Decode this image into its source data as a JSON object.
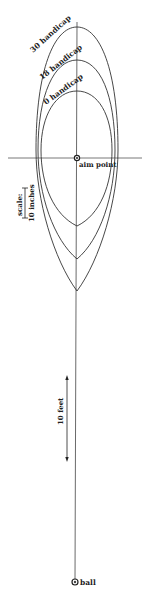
{
  "diagram": {
    "colors": {
      "line": "#333333",
      "background": "#ffffff"
    },
    "contours": [
      {
        "label": "30 handicap",
        "top_y": 27,
        "bottom_y": 291,
        "left_x": 36,
        "right_x": 118
      },
      {
        "label": "18 handicap",
        "top_y": 60,
        "bottom_y": 259,
        "left_x": 38,
        "right_x": 115
      },
      {
        "label": "0 handicap",
        "top_y": 91,
        "bottom_y": 226,
        "left_x": 41,
        "right_x": 112
      }
    ],
    "aim_point": {
      "label": "aim point",
      "x": 77,
      "y": 158
    },
    "ball": {
      "label": "ball",
      "x": 75,
      "y": 582
    },
    "scale": {
      "label_1": "scale:",
      "label_2": "10 inches"
    },
    "distance": {
      "label": "10 feet"
    }
  }
}
